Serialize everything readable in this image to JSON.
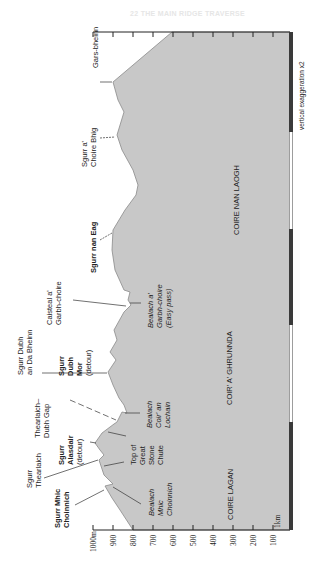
{
  "header": {
    "title": "22 THE MAIN RIDGE TRAVERSE"
  },
  "profile": {
    "fill_color": "#c8c8c8",
    "outline_color": "#8a8a8a",
    "points": "172,32 113,82 118,100 124,112 117,135 122,150 133,170 138,185 136,195 125,210 113,230 112,250 115,270 124,290 130,292 128,300 131,305 124,312 114,330 117,340 110,352 116,360 108,372 113,385 119,398 124,405 127,413 122,412 117,422 114,424 102,433 95,443 100,450 104,455 99,460 104,475 113,484 105,486 112,498 120,510 133,530 290,530 290,32"
  },
  "peaks": [
    {
      "name": "Gars-bheinn",
      "lines": [
        "Gars-bheinn"
      ],
      "style": "normal"
    },
    {
      "name": "Sgurr a' Choire Bhig",
      "lines": [
        "Sgurr a'",
        "Choire Bhig"
      ],
      "style": "normal"
    },
    {
      "name": "Sgurr nan Eag",
      "lines": [
        "Sgurr nan Eag"
      ],
      "style": "bold"
    },
    {
      "name": "Caisteal a' Garbh-choire",
      "lines": [
        "Caisteal a'",
        "Garbh-choire"
      ],
      "style": "normal"
    },
    {
      "name": "Bealach a' Garbh-choire (Easy pass)",
      "lines": [
        "Bealach a'",
        "Garbh-choire",
        "(Easy pass)"
      ],
      "style": "italic"
    },
    {
      "name": "Sgurr Dubh an Da Bheinn",
      "lines": [
        "Sgurr Dubh",
        "an Da Bheinn"
      ],
      "style": "normal"
    },
    {
      "name": "Sgurr Dubh Mor (detour)",
      "lines": [
        "Sgurr",
        "Dubh",
        "Mor",
        "(detour)"
      ],
      "style": "bold-detour"
    },
    {
      "name": "Bealach Coir' an Lochain",
      "lines": [
        "Bealach",
        "Coir' an",
        "Lochain"
      ],
      "style": "italic"
    },
    {
      "name": "Thearlaich-Dubh Gap",
      "lines": [
        "Thearlaich–",
        "Dubh Gap"
      ],
      "style": "normal"
    },
    {
      "name": "Top of Great Stone Chute",
      "lines": [
        "Top of",
        "Great",
        "Stone",
        "Chute"
      ],
      "style": "normal"
    },
    {
      "name": "Sgurr Alasdair (detour)",
      "lines": [
        "Sgurr",
        "Alasdair",
        "(detour)"
      ],
      "style": "bold-detour"
    },
    {
      "name": "Sgurr Thearlaich",
      "lines": [
        "Sgurr",
        "Thearlaich"
      ],
      "style": "normal"
    },
    {
      "name": "Sgurr Mhic Choinnich",
      "lines": [
        "Sgurr Mhic",
        "Choinnich"
      ],
      "style": "bold"
    },
    {
      "name": "Bealach Mhic Choinnich",
      "lines": [
        "Bealach",
        "Mhic",
        "Choinnich"
      ],
      "style": "italic"
    }
  ],
  "coires": [
    "COIRE NAN LAOGH",
    "COIR' A' GHRUNNDA",
    "COIRE LAGAN"
  ],
  "axis": {
    "ticks": [
      "1000m",
      "900",
      "800",
      "700",
      "600",
      "500",
      "400",
      "300",
      "200",
      "100"
    ]
  },
  "scale": {
    "label": "1km",
    "note": "vertical exaggeration x2",
    "dark_color": "#3a3a3a",
    "light_color": "#ffffff"
  }
}
